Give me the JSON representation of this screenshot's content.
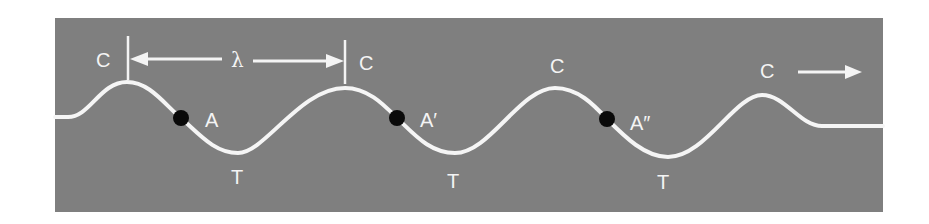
{
  "figure": {
    "type": "transverse wave diagram",
    "background_color": "#ffffff",
    "panel_color": "#7f7f7f",
    "wave_color": "#f5f5f5",
    "dot_color": "#0a0a0a",
    "label_color": "#f4f4f4"
  },
  "labels": {
    "crest_1": "C",
    "crest_2": "C",
    "crest_3": "C",
    "crest_4": "C",
    "trough_1": "T",
    "trough_2": "T",
    "trough_3": "T",
    "point_a": "A",
    "point_a_prime": "A′",
    "point_a_double_prime": "A″",
    "wavelength": "λ"
  },
  "annotations": {
    "wavelength_span": "crest 1 to crest 2",
    "direction_arrow": "right",
    "points_in_phase": [
      "A",
      "A′",
      "A″"
    ]
  }
}
